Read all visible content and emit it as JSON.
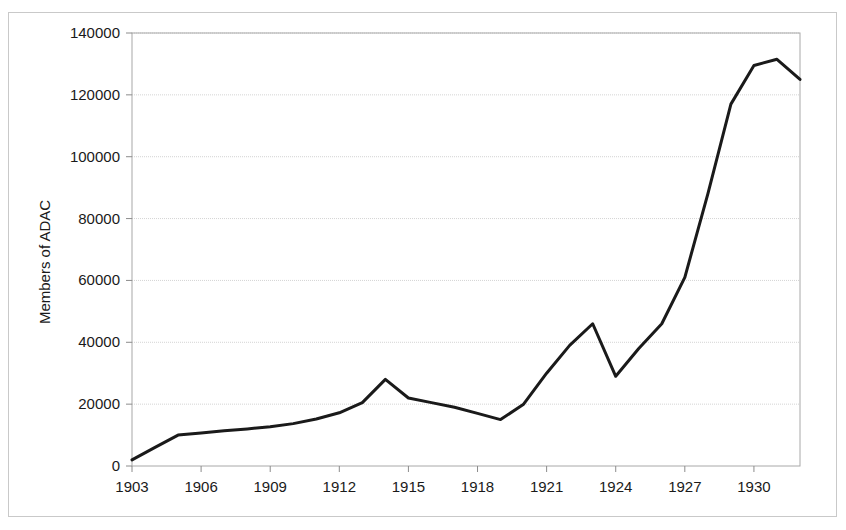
{
  "chart_data": {
    "type": "line",
    "title": "",
    "subtitle": "",
    "xlabel": "",
    "ylabel": "Members of ADAC",
    "xlim": [
      1903,
      1932
    ],
    "ylim": [
      0,
      140000
    ],
    "grid": true,
    "grid_axis": "y",
    "legend": false,
    "legend_position": "none",
    "xticks": [
      1903,
      1906,
      1909,
      1912,
      1915,
      1918,
      1921,
      1924,
      1927,
      1930
    ],
    "xtick_labels": [
      "1903",
      "1906",
      "1909",
      "1912",
      "1915",
      "1918",
      "1921",
      "1924",
      "1927",
      "1930"
    ],
    "yticks": [
      0,
      20000,
      40000,
      60000,
      80000,
      100000,
      120000,
      140000
    ],
    "ytick_labels": [
      "0",
      "20000",
      "40000",
      "60000",
      "80000",
      "100000",
      "120000",
      "140000"
    ],
    "series": [
      {
        "name": "Members of ADAC",
        "color": "#1a1a1a",
        "line_width": 3,
        "x": [
          1903,
          1904,
          1905,
          1906,
          1907,
          1908,
          1909,
          1910,
          1911,
          1912,
          1913,
          1914,
          1915,
          1916,
          1917,
          1918,
          1919,
          1920,
          1921,
          1922,
          1923,
          1924,
          1925,
          1926,
          1927,
          1928,
          1929,
          1930,
          1931,
          1932
        ],
        "values": [
          2000,
          6000,
          10000,
          10700,
          11400,
          12000,
          12700,
          13700,
          15200,
          17200,
          20500,
          28000,
          22000,
          20500,
          19000,
          17000,
          15000,
          20000,
          30000,
          39000,
          46000,
          29000,
          38000,
          46000,
          61000,
          88000,
          117000,
          129500,
          131500,
          125000
        ]
      }
    ]
  },
  "axis": {
    "y_title": "Members of ADAC"
  }
}
